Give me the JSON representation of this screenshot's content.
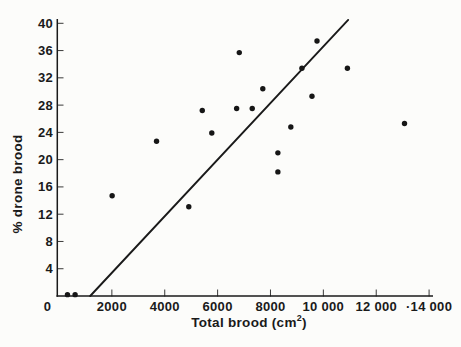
{
  "chart_data": {
    "type": "scatter",
    "title": "",
    "xlabel_base": "Total brood (cm",
    "xlabel_sup": "2",
    "xlabel_close": ")",
    "xlabel_full": "Total brood (cm²)",
    "ylabel": "% drone brood",
    "xlim": [
      0,
      14200
    ],
    "ylim": [
      0,
      40.7
    ],
    "grid": false,
    "legend": false,
    "marker": "filled-circle",
    "x_ticks": [
      0,
      2000,
      4000,
      6000,
      8000,
      10000,
      12000,
      14000
    ],
    "x_tick_labels": [
      "0",
      "2000",
      "4000",
      "6000",
      "8000",
      "10 000",
      "12 000",
      "·14 000"
    ],
    "y_ticks": [
      4,
      8,
      12,
      16,
      20,
      24,
      28,
      32,
      36,
      40
    ],
    "y_tick_labels": [
      "4",
      "8",
      "12",
      "16",
      "20",
      "24",
      "28",
      "32",
      "36",
      "40"
    ],
    "points": [
      [
        320,
        0.2
      ],
      [
        610,
        0.2
      ],
      [
        2010,
        14.7
      ],
      [
        3690,
        22.7
      ],
      [
        4910,
        13.1
      ],
      [
        5420,
        27.2
      ],
      [
        5780,
        23.9
      ],
      [
        6720,
        27.5
      ],
      [
        6820,
        35.7
      ],
      [
        7310,
        27.5
      ],
      [
        7710,
        30.4
      ],
      [
        8280,
        18.2
      ],
      [
        8280,
        21.0
      ],
      [
        8770,
        24.8
      ],
      [
        9190,
        33.4
      ],
      [
        9570,
        29.3
      ],
      [
        9760,
        37.4
      ],
      [
        10910,
        33.4
      ],
      [
        13070,
        25.3
      ]
    ],
    "regression_line": {
      "x1": 1180,
      "y1": 0,
      "x2": 10940,
      "y2": 40.5
    },
    "colors": {
      "points": "#161616",
      "line": "#1a1a1a",
      "axis": "#1a1a1a",
      "ticks": "#3a3a3a",
      "text": "#1a1a1a",
      "background": "#fcfcfa"
    }
  }
}
